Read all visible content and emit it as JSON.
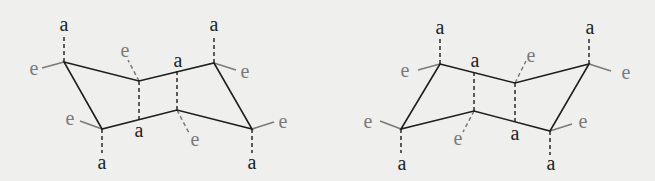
{
  "diagram": {
    "colors": {
      "background": "#efefed",
      "bond": "#1e1e1e",
      "axial_label": "#1e1e1e",
      "equatorial_label": "#7a7a7a"
    },
    "labels": {
      "axial": "a",
      "equatorial": "e"
    },
    "structures": [
      {
        "name": "chair-left",
        "atoms": [
          {
            "x": 64,
            "y": 62
          },
          {
            "x": 139,
            "y": 81
          },
          {
            "x": 214,
            "y": 63
          },
          {
            "x": 252,
            "y": 129
          },
          {
            "x": 177,
            "y": 110
          },
          {
            "x": 102,
            "y": 129
          }
        ],
        "substituents": [
          {
            "type": "a",
            "from": [
              64,
              62
            ],
            "to": [
              64,
              36
            ],
            "style": "dash",
            "label_at": [
              64,
              31
            ]
          },
          {
            "type": "e",
            "from": [
              64,
              62
            ],
            "to": [
              42,
              68
            ],
            "style": "solid",
            "label_at": [
              34,
              75
            ]
          },
          {
            "type": "e",
            "from": [
              139,
              81
            ],
            "to": [
              128,
              60
            ],
            "style": "dash",
            "label_at": [
              125,
              57
            ]
          },
          {
            "type": "a",
            "from": [
              139,
              81
            ],
            "to": [
              139,
              122
            ],
            "style": "dash",
            "label_at": [
              139,
              137
            ]
          },
          {
            "type": "a",
            "from": [
              177,
              110
            ],
            "to": [
              177,
              70
            ],
            "style": "dash",
            "label_at": [
              178,
              67
            ]
          },
          {
            "type": "e",
            "from": [
              177,
              110
            ],
            "to": [
              189,
              133
            ],
            "style": "dash",
            "label_at": [
              195,
              146
            ]
          },
          {
            "type": "a",
            "from": [
              214,
              63
            ],
            "to": [
              214,
              36
            ],
            "style": "dash",
            "label_at": [
              214,
              31
            ]
          },
          {
            "type": "e",
            "from": [
              214,
              63
            ],
            "to": [
              236,
              70
            ],
            "style": "solid",
            "label_at": [
              245,
              78
            ]
          },
          {
            "type": "e",
            "from": [
              252,
              129
            ],
            "to": [
              274,
              122
            ],
            "style": "solid",
            "label_at": [
              283,
              128
            ]
          },
          {
            "type": "a",
            "from": [
              252,
              129
            ],
            "to": [
              252,
              153
            ],
            "style": "dash",
            "label_at": [
              252,
              169
            ]
          },
          {
            "type": "e",
            "from": [
              102,
              129
            ],
            "to": [
              80,
              121
            ],
            "style": "solid",
            "label_at": [
              70,
              125
            ]
          },
          {
            "type": "a",
            "from": [
              102,
              129
            ],
            "to": [
              102,
              153
            ],
            "style": "dash",
            "label_at": [
              102,
              169
            ]
          }
        ]
      },
      {
        "name": "chair-right",
        "atoms": [
          {
            "x": 440,
            "y": 64
          },
          {
            "x": 515,
            "y": 83
          },
          {
            "x": 589,
            "y": 64
          },
          {
            "x": 550,
            "y": 131
          },
          {
            "x": 474,
            "y": 111
          },
          {
            "x": 401,
            "y": 129
          }
        ],
        "substituents": [
          {
            "type": "a",
            "from": [
              440,
              64
            ],
            "to": [
              440,
              37
            ],
            "style": "dash",
            "label_at": [
              440,
              34
            ]
          },
          {
            "type": "e",
            "from": [
              440,
              64
            ],
            "to": [
              418,
              70
            ],
            "style": "solid",
            "label_at": [
              405,
              77
            ]
          },
          {
            "type": "e",
            "from": [
              515,
              83
            ],
            "to": [
              526,
              61
            ],
            "style": "dash",
            "label_at": [
              531,
              62
            ]
          },
          {
            "type": "a",
            "from": [
              515,
              83
            ],
            "to": [
              515,
              124
            ],
            "style": "dash",
            "label_at": [
              515,
              140
            ]
          },
          {
            "type": "a",
            "from": [
              474,
              111
            ],
            "to": [
              474,
              72
            ],
            "style": "dash",
            "label_at": [
              475,
              67
            ]
          },
          {
            "type": "e",
            "from": [
              474,
              111
            ],
            "to": [
              463,
              132
            ],
            "style": "dash",
            "label_at": [
              458,
              145
            ]
          },
          {
            "type": "a",
            "from": [
              589,
              64
            ],
            "to": [
              589,
              37
            ],
            "style": "dash",
            "label_at": [
              590,
              34
            ]
          },
          {
            "type": "e",
            "from": [
              589,
              64
            ],
            "to": [
              611,
              71
            ],
            "style": "solid",
            "label_at": [
              626,
              79
            ]
          },
          {
            "type": "e",
            "from": [
              550,
              131
            ],
            "to": [
              572,
              124
            ],
            "style": "solid",
            "label_at": [
              583,
              128
            ]
          },
          {
            "type": "a",
            "from": [
              550,
              131
            ],
            "to": [
              550,
              155
            ],
            "style": "dash",
            "label_at": [
              551,
              170
            ]
          },
          {
            "type": "e",
            "from": [
              401,
              129
            ],
            "to": [
              380,
              121
            ],
            "style": "solid",
            "label_at": [
              368,
              128
            ]
          },
          {
            "type": "a",
            "from": [
              401,
              129
            ],
            "to": [
              401,
              153
            ],
            "style": "dash",
            "label_at": [
              402,
              170
            ]
          }
        ]
      }
    ]
  }
}
